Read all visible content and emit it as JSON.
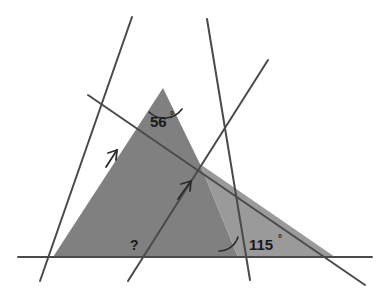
{
  "diagram": {
    "type": "geometry-angle-diagram",
    "canvas": {
      "width": 391,
      "height": 296,
      "background": "#ffffff"
    },
    "colors": {
      "background": "#ffffff",
      "shade_dark": "#808080",
      "shade_light": "#9a9a9a",
      "line": "#4a4a4a",
      "text": "#1a1a1a"
    },
    "labels": [
      {
        "name": "angle-56",
        "value": "56",
        "degree_symbol": "°",
        "x": 150,
        "y": 127,
        "deg_x": 170,
        "deg_y": 119
      },
      {
        "name": "angle-115",
        "value": "115",
        "degree_symbol": "°",
        "x": 249,
        "y": 250,
        "deg_x": 278,
        "deg_y": 242
      },
      {
        "name": "angle-unknown",
        "value": "?",
        "degree_symbol": "",
        "x": 130,
        "y": 250,
        "deg_x": 0,
        "deg_y": 0
      }
    ],
    "vertices": {
      "apex": {
        "x": 163,
        "y": 88
      },
      "bottom_left": {
        "x": 53,
        "y": 257
      },
      "bottom_right": {
        "x": 335,
        "y": 257
      },
      "center_intersection": {
        "x": 200,
        "y": 164
      }
    },
    "markers": [
      {
        "name": "parallel-arrow-left",
        "x": 113,
        "y": 157
      },
      {
        "name": "parallel-arrow-center",
        "x": 186,
        "y": 187
      }
    ],
    "arcs": [
      {
        "name": "arc-56",
        "center_x": 163,
        "center_y": 88,
        "radius": 22
      },
      {
        "name": "arc-115",
        "center_x": 238,
        "center_y": 257,
        "radius": 20
      }
    ]
  }
}
